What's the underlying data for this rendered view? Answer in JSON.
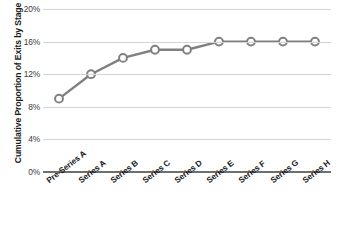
{
  "chart_data": {
    "type": "line",
    "title": "",
    "xlabel": "",
    "ylabel": "Cumulative Proportion of Exits by Stage",
    "categories": [
      "Pre-Series A",
      "Series A",
      "Series B",
      "Series C",
      "Series D",
      "Series E",
      "Series F",
      "Series G",
      "Series H"
    ],
    "values": [
      9,
      12,
      14,
      15,
      15,
      16,
      16,
      16,
      16
    ],
    "value_suffix": "%",
    "ylim": [
      0,
      20
    ],
    "yticks": [
      0,
      4,
      8,
      12,
      16,
      20
    ],
    "ytick_labels": [
      "0%",
      "4%",
      "8%",
      "12%",
      "16%",
      "20%"
    ],
    "grid": true,
    "legend": "none",
    "series_name": "Cumulative Proportion of Exits by Stage",
    "line_color": "#808080",
    "marker_fill": "#ffffff",
    "marker_edge_color": "#808080",
    "gridline_color": "#d4d4d4",
    "axis_color": "#6e6e6e",
    "background": "#ffffff"
  }
}
